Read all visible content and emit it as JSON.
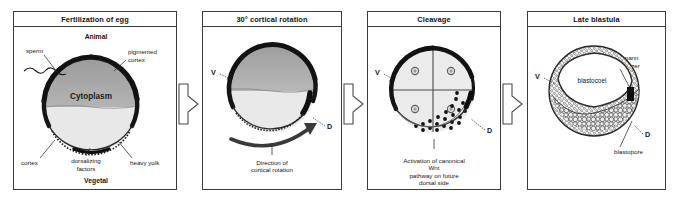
{
  "figure": {
    "panel_count": 4,
    "colors": {
      "border": "#3b3b3b",
      "pigmented_cortex": "#1a1a1a",
      "animal_cytoplasm": "#a8a8a8",
      "vegetal_yolk": "#e2e2e2",
      "text": "#151515"
    }
  },
  "panels": [
    {
      "id": "fertilization",
      "header": "Fertilization of egg",
      "labels": {
        "animal": "Animal",
        "vegetal": "Vegetal",
        "sperm": "sperm",
        "pigmented_cortex": "pigmented\ncortex",
        "pigmented_cortex_l1": "pigmented",
        "pigmented_cortex_l2": "cortex",
        "cytoplasm": "Cytoplasm",
        "cortex": "cortex",
        "dorsalizing_l1": "dorsalizing",
        "dorsalizing_l2": "factors",
        "heavy_yolk": "heavy yolk"
      }
    },
    {
      "id": "cortical-rotation",
      "header": "30° cortical rotation",
      "labels": {
        "ventral": "V",
        "dorsal": "D",
        "caption_l1": "Direction of",
        "caption_l2": "cortical rotation"
      }
    },
    {
      "id": "cleavage",
      "header": "Cleavage",
      "labels": {
        "ventral": "V",
        "dorsal": "D",
        "caption_l1": "Activation of canonical Wnt",
        "caption_l2": "pathway on future dorsal side"
      }
    },
    {
      "id": "late-blastula",
      "header": "Late blastula",
      "labels": {
        "ventral": "V",
        "dorsal": "D",
        "blastocoel": "blastocoel",
        "spemann_l1": "Spemann",
        "spemann_l2": "organizer",
        "blastopore": "blastopore"
      }
    }
  ],
  "connectors": [
    {
      "id": "arrow-1-2",
      "icon": "right-arrow-icon"
    },
    {
      "id": "arrow-2-3",
      "icon": "right-arrow-icon"
    },
    {
      "id": "arrow-3-4",
      "icon": "right-arrow-icon"
    }
  ]
}
